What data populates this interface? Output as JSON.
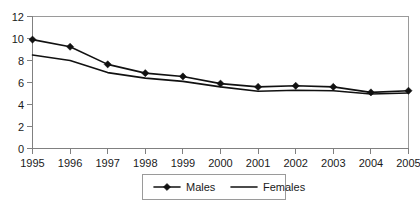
{
  "chart_data": {
    "type": "line",
    "title": "",
    "subtitle": "",
    "xlabel": "",
    "ylabel": "",
    "x": [
      "1995",
      "1996",
      "1997",
      "1998",
      "1999",
      "2000",
      "2001",
      "2002",
      "2003",
      "2004",
      "2005"
    ],
    "categories": [
      "1995",
      "1996",
      "1997",
      "1998",
      "1999",
      "2000",
      "2001",
      "2002",
      "2003",
      "2004",
      "2005"
    ],
    "series": [
      {
        "name": "Males",
        "marker": "diamond",
        "color": "#111111",
        "values": [
          9.9,
          9.25,
          7.65,
          6.85,
          6.55,
          5.9,
          5.6,
          5.7,
          5.6,
          5.1,
          5.25
        ]
      },
      {
        "name": "Females",
        "marker": "none",
        "color": "#111111",
        "values": [
          8.5,
          8.0,
          6.9,
          6.4,
          6.1,
          5.6,
          5.2,
          5.3,
          5.25,
          4.95,
          5.05
        ]
      }
    ],
    "ylim": [
      0,
      12
    ],
    "yticks": [
      0,
      2,
      4,
      6,
      8,
      10,
      12
    ],
    "ytick_labels": [
      "0",
      "2",
      "4",
      "6",
      "8",
      "10",
      "12"
    ],
    "xtick_labels": [
      "1995",
      "1996",
      "1997",
      "1998",
      "1999",
      "2000",
      "2001",
      "2002",
      "2003",
      "2004",
      "2005"
    ],
    "grid": false,
    "legend_position": "bottom",
    "legend_entries": [
      "Males",
      "Females"
    ]
  }
}
